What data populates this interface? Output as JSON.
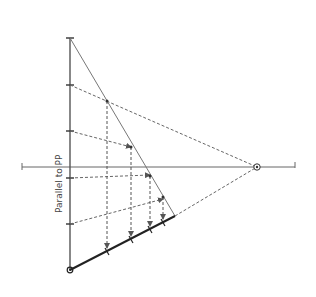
{
  "diagram": {
    "title": "",
    "labels": {
      "parallel_label": "Parallel to PP"
    },
    "colors": {
      "background": "#ffffff",
      "line": "#555555",
      "thick_line": "#222222",
      "dashed": "#666666"
    },
    "geometry": {
      "vertical_line": {
        "x": 70,
        "y1": 38,
        "y2": 270
      },
      "horizon_line": {
        "x1": 22,
        "x2": 295,
        "y": 167
      },
      "vanishing_point": {
        "x": 257,
        "y": 167
      },
      "diagonal": {
        "x1": 70,
        "y1": 38,
        "x2": 175,
        "y2": 216
      },
      "thick_line": {
        "x1": 70,
        "y1": 270,
        "x2": 175,
        "y2": 216
      },
      "ticks_on_vertical": [
        85,
        131,
        178,
        224
      ],
      "diagonal_points": [
        {
          "x": 107,
          "y": 101
        },
        {
          "x": 131,
          "y": 147
        },
        {
          "x": 150,
          "y": 177
        },
        {
          "x": 163,
          "y": 197
        }
      ],
      "projected_points": [
        {
          "x": 107,
          "y": 251
        },
        {
          "x": 131,
          "y": 239
        },
        {
          "x": 150,
          "y": 229
        },
        {
          "x": 163,
          "y": 222
        }
      ]
    }
  }
}
